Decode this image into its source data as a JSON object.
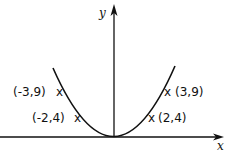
{
  "diagram": {
    "type": "function-graph",
    "function": "y = x^2",
    "axes": {
      "x_label": "x",
      "y_label": "y"
    },
    "points": [
      {
        "label": "(-3,9)",
        "x": -3,
        "y": 9
      },
      {
        "label": "(-2,4)",
        "x": -2,
        "y": 4
      },
      {
        "label": "(2,4)",
        "x": 2,
        "y": 4
      },
      {
        "label": "(3,9)",
        "x": 3,
        "y": 9
      }
    ],
    "marker": "x",
    "colors": {
      "ink": "#111111",
      "background": "#ffffff"
    }
  }
}
